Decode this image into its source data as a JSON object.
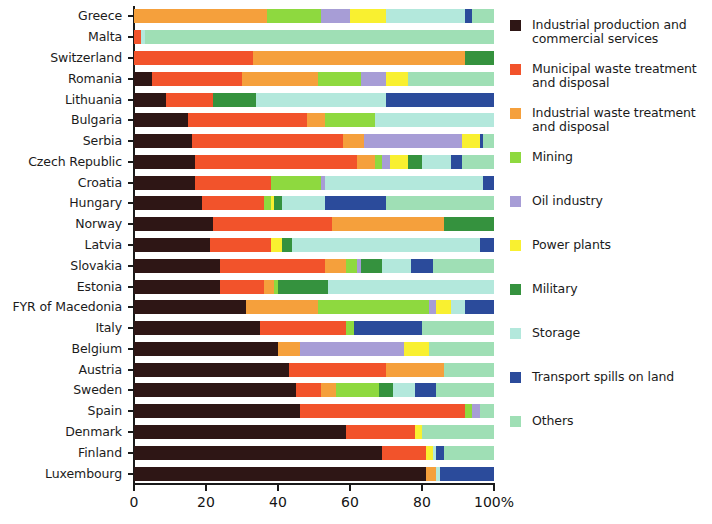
{
  "chart_data": {
    "type": "bar",
    "orientation": "horizontal",
    "stacked": true,
    "normalized_percent": true,
    "title": "",
    "xlabel": "",
    "ylabel": "",
    "xlim": [
      0,
      100
    ],
    "grid": false,
    "legend_position": "right",
    "xticks": [
      {
        "value": 0,
        "label": "0"
      },
      {
        "value": 20,
        "label": "20"
      },
      {
        "value": 40,
        "label": "40"
      },
      {
        "value": 60,
        "label": "60"
      },
      {
        "value": 80,
        "label": "80"
      },
      {
        "value": 100,
        "label": "100%"
      }
    ],
    "categories": [
      "Greece",
      "Malta",
      "Switzerland",
      "Romania",
      "Lithuania",
      "Bulgaria",
      "Serbia",
      "Czech Republic",
      "Croatia",
      "Hungary",
      "Norway",
      "Latvia",
      "Slovakia",
      "Estonia",
      "FYR of Macedonia",
      "Italy",
      "Belgium",
      "Austria",
      "Sweden",
      "Spain",
      "Denmark",
      "Finland",
      "Luxembourg"
    ],
    "series": [
      {
        "name": "Industrial production and\ncommercial services",
        "color": "#2e1615",
        "values": [
          0,
          0,
          0,
          5,
          9,
          15,
          16,
          17,
          17,
          19,
          22,
          21,
          24,
          24,
          31,
          35,
          40,
          43,
          45,
          46,
          59,
          69,
          81
        ]
      },
      {
        "name": "Municipal waste treatment\nand disposal",
        "color": "#f2532b",
        "values": [
          0,
          2,
          33,
          25,
          13,
          33,
          42,
          45,
          21,
          17,
          33,
          17,
          29,
          12,
          0,
          24,
          0,
          27,
          7,
          46,
          19,
          12,
          0
        ]
      },
      {
        "name": "Industrial waste treatment\nand disposal",
        "color": "#f5a03c",
        "values": [
          37,
          0,
          59,
          21,
          0,
          5,
          6,
          5,
          0,
          0,
          31,
          0,
          6,
          3,
          20,
          0,
          6,
          16,
          4,
          0,
          0,
          0,
          3
        ]
      },
      {
        "name": "Mining",
        "color": "#8ed93f",
        "values": [
          15,
          0,
          0,
          12,
          0,
          14,
          0,
          2,
          14,
          2,
          0,
          0,
          3,
          1,
          31,
          2,
          0,
          0,
          12,
          2,
          0,
          0,
          0
        ]
      },
      {
        "name": "Oil industry",
        "color": "#a79dd6",
        "values": [
          8,
          0,
          0,
          7,
          0,
          0,
          27,
          2,
          1,
          0,
          0,
          0,
          1,
          0,
          2,
          0,
          29,
          0,
          0,
          2,
          0,
          0,
          0
        ]
      },
      {
        "name": "Power plants",
        "color": "#f9f030",
        "values": [
          10,
          0,
          0,
          6,
          0,
          0,
          5,
          5,
          0,
          1,
          0,
          3,
          0,
          0,
          4,
          0,
          7,
          0,
          0,
          0,
          2,
          2,
          0
        ]
      },
      {
        "name": "Military",
        "color": "#35923e",
        "values": [
          0,
          0,
          8,
          0,
          12,
          0,
          0,
          4,
          0,
          2,
          14,
          3,
          6,
          14,
          0,
          0,
          0,
          0,
          4,
          0,
          0,
          0,
          0
        ]
      },
      {
        "name": "Storage",
        "color": "#b3e8dc",
        "values": [
          22,
          1,
          0,
          0,
          36,
          33,
          0,
          8,
          44,
          12,
          0,
          52,
          8,
          46,
          4,
          0,
          0,
          0,
          6,
          0,
          0,
          1,
          1
        ]
      },
      {
        "name": "Transport spills on land",
        "color": "#2b4b9b",
        "values": [
          2,
          0,
          0,
          0,
          30,
          0,
          1,
          3,
          3,
          17,
          0,
          4,
          6,
          0,
          8,
          19,
          0,
          0,
          6,
          0,
          0,
          2,
          15
        ]
      },
      {
        "name": "Others",
        "color": "#9fdfb5",
        "values": [
          6,
          97,
          0,
          24,
          0,
          0,
          3,
          9,
          0,
          30,
          0,
          0,
          17,
          0,
          0,
          20,
          18,
          14,
          16,
          4,
          20,
          14,
          0
        ]
      }
    ]
  }
}
